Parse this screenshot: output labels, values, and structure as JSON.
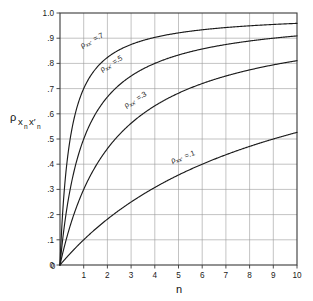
{
  "chart_data": {
    "type": "line",
    "title": "",
    "xlabel": "n",
    "ylabel": "ρ",
    "ylabel_sub": "x",
    "ylabel_sub2": "n",
    "ylabel_sub3": "x'",
    "ylabel_sub4": "n",
    "xlim": [
      0,
      10
    ],
    "ylim": [
      0,
      1.0
    ],
    "grid": true,
    "legend_position": "inline-curve-labels",
    "x_tick_labels": [
      "0",
      "1",
      "2",
      "3",
      "4",
      "5",
      "6",
      "7",
      "8",
      "9",
      "10"
    ],
    "x_tick_values": [
      0,
      1,
      2,
      3,
      4,
      5,
      6,
      7,
      8,
      9,
      10
    ],
    "y_tick_labels": [
      "0",
      ".1",
      ".2",
      ".3",
      ".4",
      ".5",
      ".6",
      ".7",
      ".8",
      ".9",
      "1.0"
    ],
    "y_tick_values": [
      0,
      0.1,
      0.2,
      0.3,
      0.4,
      0.5,
      0.6,
      0.7,
      0.8,
      0.9,
      1.0
    ],
    "x": [
      0,
      1,
      2,
      3,
      4,
      5,
      6,
      7,
      8,
      9,
      10
    ],
    "series": [
      {
        "name": "ρxx'=.7",
        "rho": 0.7,
        "label": "ρxx'=.7",
        "values": [
          0,
          0.7,
          0.824,
          0.875,
          0.903,
          0.921,
          0.933,
          0.942,
          0.949,
          0.955,
          0.959
        ]
      },
      {
        "name": "ρxx'=.5",
        "rho": 0.5,
        "label": "ρxx'=.5",
        "values": [
          0,
          0.5,
          0.667,
          0.75,
          0.8,
          0.833,
          0.857,
          0.875,
          0.889,
          0.9,
          0.909
        ]
      },
      {
        "name": "ρxx'=.3",
        "rho": 0.3,
        "label": "ρxx'=.3",
        "values": [
          0,
          0.3,
          0.462,
          0.563,
          0.632,
          0.682,
          0.72,
          0.75,
          0.774,
          0.794,
          0.811
        ]
      },
      {
        "name": "ρxx'=.1",
        "rho": 0.1,
        "label": "ρxx'=.1",
        "values": [
          0,
          0.1,
          0.182,
          0.25,
          0.308,
          0.357,
          0.4,
          0.438,
          0.471,
          0.5,
          0.526
        ]
      }
    ],
    "curve_labels": [
      {
        "text_rho": "ρ",
        "text_sub": "xx'",
        "text_val": "=.7",
        "x": 82,
        "y": 48,
        "rotation": -27
      },
      {
        "text_rho": "ρ",
        "text_sub": "xx'",
        "text_val": "=.5",
        "x": 102,
        "y": 72,
        "rotation": -31
      },
      {
        "text_rho": "ρ",
        "text_sub": "xx'",
        "text_val": "=.3",
        "x": 126,
        "y": 108,
        "rotation": -31
      },
      {
        "text_rho": "ρ",
        "text_sub": "xx'",
        "text_val": "=.1",
        "x": 172,
        "y": 163,
        "rotation": -19
      }
    ],
    "colors": {
      "curve": "#1c1c1c",
      "grid": "#9a9a9a",
      "frame": "#3a3a3a",
      "text": "#1a1a1a",
      "background": "#ffffff"
    }
  },
  "axis": {
    "x_title": "n",
    "y_title_base": "ρ",
    "y_title_full": "ρ x n x' n"
  }
}
